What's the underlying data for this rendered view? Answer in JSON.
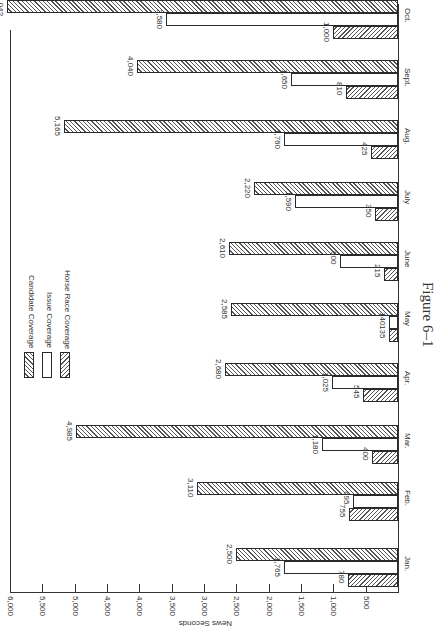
{
  "chart_data": {
    "type": "bar",
    "orientation": "rotated 90deg clockwise (value axis horizontal along bottom, 6,000 at left to 0 at right)",
    "title": "Figure 6–1",
    "xlabel": "",
    "ylabel": "News Seconds",
    "ylim": [
      0,
      6000
    ],
    "yticks": [
      "500",
      "1,000",
      "1,500",
      "2,000",
      "2,500",
      "3,000",
      "3,500",
      "4,000",
      "4,500",
      "5,000",
      "5,500",
      "6,000"
    ],
    "categories": [
      "Jan.",
      "Feb.",
      "Mar.",
      "Apr.",
      "May",
      "June",
      "July",
      "Aug.",
      "Sept.",
      "Oct."
    ],
    "series": [
      {
        "name": "Horse Race Coverage",
        "values": [
          780,
          755,
          400,
          545,
          135,
          215,
          350,
          425,
          810,
          1000
        ],
        "labels": [
          "780",
          "755",
          "400",
          "545",
          "135",
          "215",
          "350",
          "425",
          "810",
          "1,000"
        ]
      },
      {
        "name": "Issue Coverage",
        "values": [
          1765,
          695,
          1180,
          1025,
          140,
          900,
          1590,
          1760,
          1650,
          3580
        ],
        "labels": [
          "1,765",
          "695",
          "1,180",
          "1,025",
          "140",
          "900",
          "1,590",
          "1,760",
          "1,650",
          "3,580"
        ]
      },
      {
        "name": "Candidate Coverage",
        "values": [
          2500,
          3110,
          4985,
          2680,
          2585,
          2610,
          2220,
          5165,
          4040,
          6040
        ],
        "labels": [
          "2,500",
          "3,110",
          "4,985",
          "2,680",
          "2,585",
          "2,610",
          "2,220",
          "5,165",
          "4,040",
          "6,04?"
        ]
      }
    ],
    "legend": [
      "Candidate Coverage",
      "Issue Coverage",
      "Horse Race Coverage"
    ],
    "legend_position": "upper-left inside plot (rotated)",
    "grid": false
  }
}
